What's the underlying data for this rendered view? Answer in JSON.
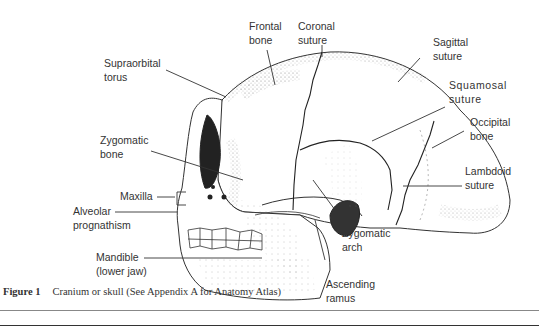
{
  "figure": {
    "labels": {
      "frontal_bone": "Frontal\nbone",
      "coronal_suture": "Coronal\nsuture",
      "sagittal_suture": "Sagittal\nsuture",
      "squamosal_suture": "Squamosal\nsuture",
      "occipital_bone": "Occipital\nbone",
      "lambdoid_suture": "Lambdoid\nsuture",
      "supraorbital_torus": "Supraorbital\ntorus",
      "zygomatic_bone": "Zygomatic\nbone",
      "maxilla": "Maxilla",
      "alveolar_prognathism": "Alveolar\nprognathism",
      "mandible": "Mandible\n(lower jaw)",
      "zygomatic_arch": "Zygomatic\narch",
      "ascending_ramus": "Ascending\nramus"
    },
    "caption": {
      "number": "Figure 1",
      "text": "Cranium or skull (See Appendix A for Anatomy Atlas)"
    }
  }
}
